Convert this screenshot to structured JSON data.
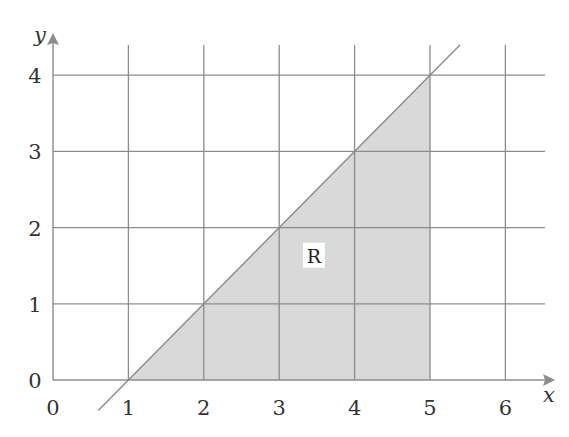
{
  "chart_data": {
    "type": "area",
    "title": "",
    "xlabel": "x",
    "ylabel": "y",
    "xlim": [
      0,
      6.5
    ],
    "ylim": [
      0,
      4.4
    ],
    "grid": true,
    "x_ticks": [
      "0",
      "1",
      "2",
      "3",
      "4",
      "5",
      "6"
    ],
    "y_ticks": [
      "0",
      "1",
      "2",
      "3",
      "4"
    ],
    "line": {
      "equation": "y = x - 1",
      "x_range": [
        0.6,
        5.4
      ]
    },
    "region": {
      "label": "R",
      "description": "bounded by y = x - 1, y = 0, and x = 5",
      "vertices": [
        [
          1,
          0
        ],
        [
          5,
          0
        ],
        [
          5,
          4
        ]
      ],
      "label_position": [
        3.5,
        1.5
      ]
    },
    "colors": {
      "region_fill": "#d9d9d9",
      "grid": "#8c8c8c",
      "line": "#8a8a8a",
      "text": "#333333"
    }
  }
}
